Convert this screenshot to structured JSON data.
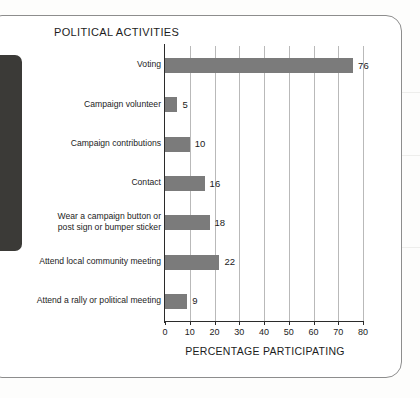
{
  "figure": {
    "title": "POLITICAL ACTIVITIES",
    "frame_color": "#8d8d8d",
    "background": "#ffffff",
    "left_panel_color": "#3b3a37"
  },
  "chart_data": {
    "type": "bar",
    "orientation": "horizontal",
    "title": "POLITICAL ACTIVITIES",
    "xlabel": "PERCENTAGE PARTICIPATING",
    "ylabel": "",
    "xlim": [
      0,
      80
    ],
    "xticks": [
      "0",
      "10",
      "20",
      "30",
      "40",
      "50",
      "60",
      "70",
      "80"
    ],
    "xtick_values": [
      0,
      10,
      20,
      30,
      40,
      50,
      60,
      70,
      80
    ],
    "grid": "vertical",
    "legend": "none",
    "bar_color": "#7b7b7b",
    "categories": [
      "Voting",
      "Campaign volunteer",
      "Campaign contributions",
      "Contact",
      "Wear a campaign button or post sign or bumper sticker",
      "Attend local community meeting",
      "Attend a rally or political meeting"
    ],
    "category_lines": [
      [
        "Voting"
      ],
      [
        "Campaign volunteer"
      ],
      [
        "Campaign contributions"
      ],
      [
        "Contact"
      ],
      [
        "Wear a campaign button or",
        "post sign or bumper sticker"
      ],
      [
        "Attend local community meeting"
      ],
      [
        "Attend a rally or political meeting"
      ]
    ],
    "values": [
      76,
      5,
      10,
      16,
      18,
      22,
      9
    ],
    "value_labels": [
      "76",
      "5",
      "10",
      "16",
      "18",
      "22",
      "9"
    ]
  }
}
